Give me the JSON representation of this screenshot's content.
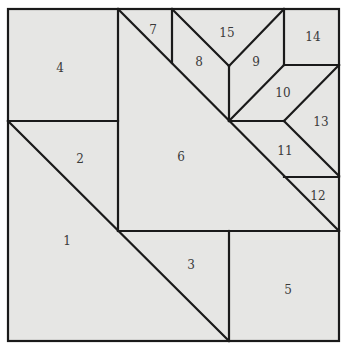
{
  "diagram": {
    "type": "quilt-block-pattern",
    "background": "#e6e6e4",
    "line_color": "#1a1a1a",
    "pieces": [
      {
        "id": "1",
        "label": "1",
        "x": 67,
        "y": 241
      },
      {
        "id": "2",
        "label": "2",
        "x": 80,
        "y": 159
      },
      {
        "id": "3",
        "label": "3",
        "x": 191,
        "y": 265
      },
      {
        "id": "4",
        "label": "4",
        "x": 60,
        "y": 68
      },
      {
        "id": "5",
        "label": "5",
        "x": 288,
        "y": 290
      },
      {
        "id": "6",
        "label": "6",
        "x": 181,
        "y": 157
      },
      {
        "id": "7",
        "label": "7",
        "x": 153,
        "y": 30
      },
      {
        "id": "8",
        "label": "8",
        "x": 199,
        "y": 62
      },
      {
        "id": "9",
        "label": "9",
        "x": 256,
        "y": 62
      },
      {
        "id": "10",
        "label": "10",
        "x": 283,
        "y": 93
      },
      {
        "id": "11",
        "label": "11",
        "x": 285,
        "y": 151
      },
      {
        "id": "12",
        "label": "12",
        "x": 318,
        "y": 196
      },
      {
        "id": "13",
        "label": "13",
        "x": 321,
        "y": 122
      },
      {
        "id": "14",
        "label": "14",
        "x": 313,
        "y": 37
      },
      {
        "id": "15",
        "label": "15",
        "x": 227,
        "y": 33
      }
    ]
  }
}
